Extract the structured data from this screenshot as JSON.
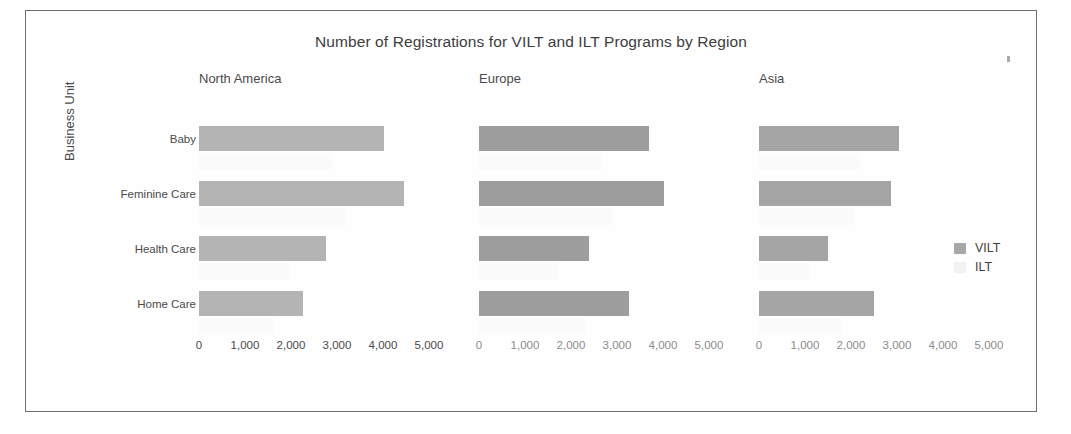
{
  "figure": {
    "title": "Number of Registrations for VILT and ILT Programs by Region",
    "y_axis_title": "Business Unit",
    "border_color": "#6e6e6e",
    "background": "#ffffff"
  },
  "legend": {
    "position": "right",
    "items": [
      {
        "label": "VILT",
        "color": "#a8a8a8"
      },
      {
        "label": "ILT",
        "color": "#f2f2f2"
      }
    ]
  },
  "artifact": {
    "name": "scan-speck"
  },
  "chart_data": {
    "type": "bar",
    "orientation": "horizontal",
    "title": "Number of Registrations for VILT and ILT Programs by Region",
    "xlabel": "",
    "ylabel": "Business Unit",
    "xlim": [
      0,
      5000
    ],
    "xticks": [
      0,
      1000,
      2000,
      3000,
      4000,
      5000
    ],
    "xtick_labels": [
      "0",
      "1,000",
      "2,000",
      "3,000",
      "4,000",
      "5,000"
    ],
    "grid": false,
    "legend_position": "right",
    "categories": [
      "Baby",
      "Feminine Care",
      "Health Care",
      "Home Care"
    ],
    "panels": [
      {
        "name": "North America",
        "bar_color": "#b4b4b4",
        "series": [
          {
            "name": "VILT",
            "values": [
              4020,
              4450,
              2750,
              2250
            ]
          },
          {
            "name": "ILT",
            "values": [
              0,
              0,
              0,
              0
            ]
          }
        ]
      },
      {
        "name": "Europe",
        "bar_color": "#9d9d9d",
        "series": [
          {
            "name": "VILT",
            "values": [
              3700,
              4020,
              2400,
              3250
            ]
          },
          {
            "name": "ILT",
            "values": [
              0,
              0,
              0,
              0
            ]
          }
        ]
      },
      {
        "name": "Asia",
        "bar_color": "#a5a5a5",
        "series": [
          {
            "name": "VILT",
            "values": [
              3050,
              2870,
              1500,
              2500
            ]
          },
          {
            "name": "ILT",
            "values": [
              0,
              0,
              0,
              0
            ]
          }
        ]
      }
    ]
  }
}
